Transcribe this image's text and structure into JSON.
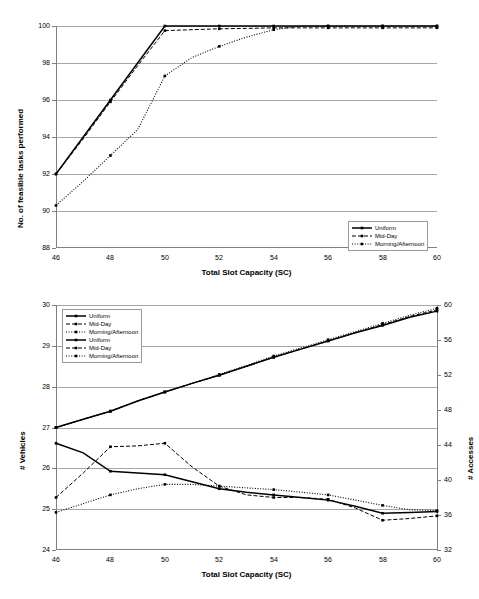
{
  "figure": {
    "title": "",
    "panels": [
      "top",
      "bottom"
    ]
  },
  "top": {
    "ylabel": "No. of feasible tasks performed",
    "xlabel": "Total Slot Capacity (SC)",
    "yticks": [
      "100",
      "98",
      "96",
      "94",
      "92",
      "90",
      "88"
    ],
    "xticks": [
      "46",
      "48",
      "50",
      "52",
      "54",
      "56",
      "58",
      "60"
    ],
    "legend": {
      "items": [
        {
          "label": "Uniform",
          "style": "solid-thick"
        },
        {
          "label": "Mid-Day",
          "style": "solid-thin"
        },
        {
          "label": "Morning/Afternoon",
          "style": "dash-dot"
        }
      ]
    }
  },
  "bottom": {
    "ylabel_left": "# Vehicles",
    "ylabel_right": "# Accesses",
    "xlabel": "Total Slot Capacity (SC)",
    "yticks_left": [
      "30",
      "29",
      "28",
      "27",
      "26",
      "25",
      "24"
    ],
    "yticks_right": [
      "60",
      "56",
      "52",
      "48",
      "44",
      "40",
      "36",
      "32"
    ],
    "xticks": [
      "46",
      "48",
      "50",
      "52",
      "54",
      "56",
      "58",
      "60"
    ],
    "legend": {
      "items": [
        {
          "label": "Uniform",
          "style": "solid-thick"
        },
        {
          "label": "Mid-Day",
          "style": "solid-thin"
        },
        {
          "label": "Morning/Afternoon",
          "style": "dash-dot"
        },
        {
          "label": "Uniform",
          "style": "solid-thick"
        },
        {
          "label": "Mid-Day",
          "style": "solid-thin"
        },
        {
          "label": "Morning/Afternoon",
          "style": "dash-dot"
        }
      ]
    }
  },
  "chart_data": [
    {
      "type": "line",
      "panel": "top",
      "title": "",
      "xlabel": "Total Slot Capacity (SC)",
      "ylabel": "No. of feasible tasks performed",
      "xlim": [
        46,
        60
      ],
      "ylim": [
        88,
        100
      ],
      "ytick_step": 2,
      "xtick_step": 2,
      "grid": "horizontal",
      "legend_position": "bottom-right-inside",
      "x": [
        46,
        47,
        48,
        49,
        50,
        51,
        52,
        53,
        54,
        55,
        56,
        57,
        58,
        59,
        60
      ],
      "series": [
        {
          "name": "Uniform",
          "style": "solid-thick",
          "values": [
            92.0,
            94.0,
            96.0,
            98.0,
            100.0,
            100.0,
            100.0,
            100.0,
            100.0,
            100.0,
            100.0,
            100.0,
            100.0,
            100.0,
            100.0
          ]
        },
        {
          "name": "Mid-Day",
          "style": "solid-thin",
          "values": [
            92.0,
            93.9,
            95.9,
            97.85,
            99.75,
            99.8,
            99.85,
            99.87,
            99.9,
            99.9,
            99.9,
            99.9,
            99.9,
            99.9,
            99.9
          ]
        },
        {
          "name": "Morning/Afternoon",
          "style": "dash-dot",
          "values": [
            90.3,
            91.6,
            93.0,
            94.4,
            97.3,
            98.3,
            98.9,
            99.4,
            99.8,
            100.0,
            100.0,
            100.0,
            100.0,
            100.0,
            100.0
          ]
        }
      ]
    },
    {
      "type": "line",
      "panel": "bottom",
      "title": "",
      "xlabel": "Total Slot Capacity (SC)",
      "ylabel_left": "# Vehicles",
      "ylabel_right": "# Accesses",
      "xlim": [
        46,
        60
      ],
      "ylim_left": [
        24,
        30
      ],
      "ylim_right": [
        32,
        60
      ],
      "ytick_step_left": 1,
      "ytick_step_right": 4,
      "xtick_step": 2,
      "grid": "horizontal",
      "legend_position": "top-left-inside",
      "x": [
        46,
        47,
        48,
        49,
        50,
        51,
        52,
        53,
        54,
        55,
        56,
        57,
        58,
        59,
        60
      ],
      "series_vehicles": [
        {
          "name": "Uniform",
          "axis": "left",
          "style": "solid-thick",
          "values": [
            27.0,
            27.2,
            27.4,
            27.65,
            27.87,
            28.08,
            28.28,
            28.5,
            28.72,
            28.92,
            29.12,
            29.32,
            29.5,
            29.7,
            29.85
          ]
        },
        {
          "name": "Mid-Day",
          "axis": "left",
          "style": "solid-thin",
          "values": [
            27.0,
            27.2,
            27.4,
            27.65,
            27.87,
            28.08,
            28.28,
            28.5,
            28.72,
            28.92,
            29.12,
            29.32,
            29.52,
            29.72,
            29.88
          ]
        },
        {
          "name": "Morning/Afternoon",
          "axis": "left",
          "style": "dash-dot",
          "values": [
            27.0,
            27.2,
            27.4,
            27.65,
            27.87,
            28.08,
            28.3,
            28.52,
            28.75,
            28.95,
            29.15,
            29.35,
            29.55,
            29.75,
            29.92
          ]
        }
      ],
      "series_accesses": [
        {
          "name": "Uniform",
          "axis": "right",
          "style": "solid-thick",
          "values": [
            44.2,
            43.1,
            41.0,
            40.8,
            40.6,
            39.8,
            39.0,
            38.6,
            38.3,
            38.0,
            37.7,
            37.0,
            36.2,
            36.3,
            36.4
          ]
        },
        {
          "name": "Mid-Day",
          "axis": "right",
          "style": "solid-thin",
          "values": [
            38.0,
            40.8,
            43.8,
            43.9,
            44.2,
            41.5,
            39.3,
            38.3,
            38.0,
            38.0,
            37.8,
            36.8,
            35.4,
            35.6,
            35.9
          ]
        },
        {
          "name": "Morning/Afternoon",
          "axis": "right",
          "style": "dash-dot",
          "values": [
            36.3,
            37.3,
            38.3,
            39.0,
            39.5,
            39.5,
            39.3,
            39.1,
            38.9,
            38.6,
            38.3,
            37.7,
            37.1,
            36.6,
            36.5
          ]
        }
      ]
    }
  ]
}
